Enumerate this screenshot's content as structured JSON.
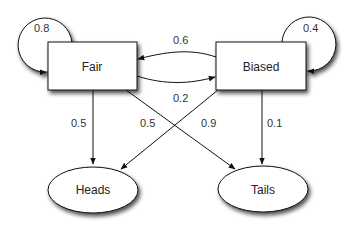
{
  "diagram": {
    "type": "markov-chain",
    "nodes": {
      "fair": {
        "label": "Fair",
        "shape": "rectangle"
      },
      "biased": {
        "label": "Biased",
        "shape": "rectangle"
      },
      "heads": {
        "label": "Heads",
        "shape": "ellipse"
      },
      "tails": {
        "label": "Tails",
        "shape": "ellipse"
      }
    },
    "edges": {
      "fair_fair": {
        "from": "Fair",
        "to": "Fair",
        "label": "0.8"
      },
      "biased_biased": {
        "from": "Biased",
        "to": "Biased",
        "label": "0.4"
      },
      "biased_fair": {
        "from": "Biased",
        "to": "Fair",
        "label": "0.6"
      },
      "fair_biased": {
        "from": "Fair",
        "to": "Biased",
        "label": "0.2"
      },
      "fair_heads": {
        "from": "Fair",
        "to": "Heads",
        "label": "0.5"
      },
      "fair_tails": {
        "from": "Fair",
        "to": "Tails",
        "label": "0.5"
      },
      "biased_heads": {
        "from": "Biased",
        "to": "Heads",
        "label": "0.9"
      },
      "biased_tails": {
        "from": "Biased",
        "to": "Tails",
        "label": "0.1"
      }
    }
  }
}
